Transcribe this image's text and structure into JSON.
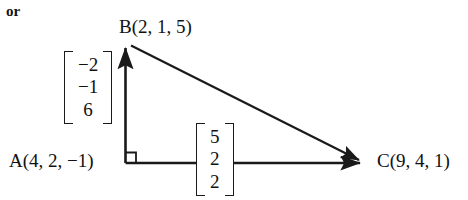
{
  "figure": {
    "or_text": "or",
    "background_color": "#ffffff",
    "stroke_color": "#1a1a1a",
    "points": [
      {
        "name": "B",
        "label": "B(2, 1, 5)",
        "x": 125,
        "y": 43
      },
      {
        "name": "A",
        "label": "A(4, 2, −1)",
        "x": 125,
        "y": 163
      },
      {
        "name": "C",
        "label": "C(9, 4, 1)",
        "x": 367,
        "y": 163
      }
    ],
    "vectors": [
      {
        "name": "AB",
        "components": [
          "−2",
          "−1",
          "6"
        ],
        "from": "A",
        "to": "B",
        "direction": "vertical-up"
      },
      {
        "name": "AC",
        "components": [
          "5",
          "2",
          "2"
        ],
        "from": "A",
        "to": "C",
        "direction": "horizontal-right"
      }
    ],
    "right_angle_marker": {
      "at": "A",
      "size": 11
    },
    "segments": [
      {
        "name": "AB",
        "arrow": true
      },
      {
        "name": "AC",
        "arrow": true
      },
      {
        "name": "BC",
        "arrow": true
      }
    ]
  }
}
